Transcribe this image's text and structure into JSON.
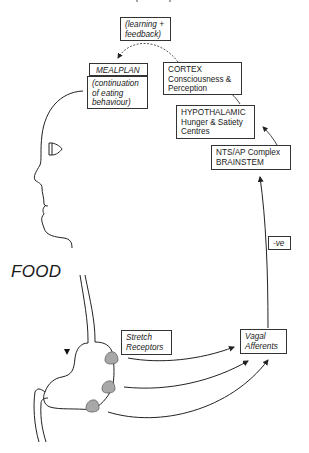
{
  "diagram": {
    "boxes": {
      "feedback": {
        "line1": "(learning +",
        "line2": "feedback)"
      },
      "mealplan": {
        "title": "MEALPLAN",
        "line1": "(continuation",
        "line2": "of eating",
        "line3": "behaviour)"
      },
      "cortex": {
        "line1": "CORTEX",
        "line2": "Consciousness &",
        "line3": "Perception"
      },
      "hypothalamic": {
        "line1": "HYPOTHALAMIC",
        "line2": "Hunger & Satiety",
        "line3": "Centres"
      },
      "brainstem": {
        "line1": "NTS/AP Complex",
        "line2": "BRAINSTEM"
      },
      "negative": {
        "label": "-ve"
      },
      "stretch": {
        "line1": "Stretch",
        "line2": "Receptors"
      },
      "vagal": {
        "line1": "Vagal",
        "line2": "Afferents"
      }
    },
    "food_label": "FOOD",
    "colors": {
      "line": "#2a2a2a",
      "receptor_fill": "#a8a8a8"
    }
  }
}
